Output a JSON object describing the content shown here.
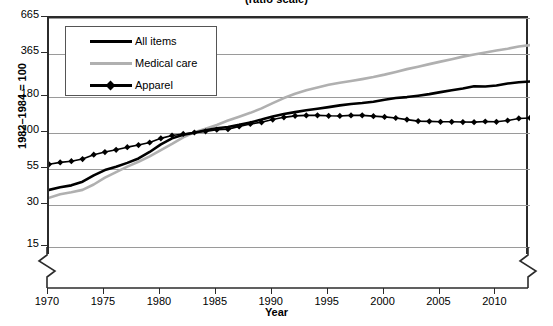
{
  "chart_data": {
    "type": "line",
    "title": "(ratio scale)",
    "xlabel": "Year",
    "ylabel": "1982–1984 = 100",
    "scale": "log",
    "grid": true,
    "legend_position": "top-left",
    "axis_breaks": [
      "y-axis-bottom-left",
      "y-axis-bottom-right"
    ],
    "yticks": [
      15,
      30,
      55,
      100,
      180,
      365,
      665
    ],
    "ytick_labels": [
      "15",
      "30",
      "55",
      "100",
      "180",
      "365",
      "665"
    ],
    "ylim": [
      13,
      665
    ],
    "xticks": [
      1970,
      1975,
      1980,
      1985,
      1990,
      1995,
      2000,
      2005,
      2010
    ],
    "xtick_labels": [
      "1970",
      "1975",
      "1980",
      "1985",
      "1990",
      "1995",
      "2000",
      "2005",
      "2010"
    ],
    "xlim": [
      1970,
      2013
    ],
    "x": [
      1970,
      1971,
      1972,
      1973,
      1974,
      1975,
      1976,
      1977,
      1978,
      1979,
      1980,
      1981,
      1982,
      1983,
      1984,
      1985,
      1986,
      1987,
      1988,
      1989,
      1990,
      1991,
      1992,
      1993,
      1994,
      1995,
      1996,
      1997,
      1998,
      1999,
      2000,
      2001,
      2002,
      2003,
      2004,
      2005,
      2006,
      2007,
      2008,
      2009,
      2010,
      2011,
      2012,
      2013
    ],
    "series": [
      {
        "name": "All items",
        "color": "#000000",
        "marker": "none",
        "values": [
          38.8,
          40.5,
          41.8,
          44.4,
          49.3,
          53.8,
          56.9,
          60.6,
          65.2,
          72.6,
          82.4,
          90.9,
          96.5,
          99.6,
          103.9,
          107.6,
          109.6,
          113.6,
          118.3,
          124.0,
          130.7,
          136.2,
          140.3,
          144.5,
          148.2,
          152.4,
          156.9,
          160.5,
          163.0,
          166.6,
          172.2,
          177.1,
          179.9,
          184.0,
          188.9,
          195.3,
          201.6,
          207.3,
          215.3,
          214.5,
          218.1,
          224.9,
          229.6,
          233.0
        ]
      },
      {
        "name": "Medical care",
        "color": "#b0b0b0",
        "marker": "none",
        "values": [
          34.0,
          36.1,
          37.3,
          38.8,
          42.4,
          47.5,
          52.0,
          57.0,
          61.8,
          67.5,
          74.9,
          82.9,
          92.5,
          100.6,
          106.8,
          113.5,
          122.0,
          130.1,
          138.6,
          149.3,
          162.8,
          177.0,
          190.1,
          201.4,
          211.0,
          220.5,
          228.2,
          234.6,
          242.1,
          250.6,
          260.8,
          272.8,
          285.6,
          297.1,
          310.1,
          323.2,
          336.2,
          351.1,
          364.1,
          375.6,
          388.4,
          400.3,
          414.9,
          425.0
        ]
      },
      {
        "name": "Apparel",
        "color": "#000000",
        "marker": "diamond",
        "values": [
          59.2,
          61.1,
          62.3,
          64.6,
          69.4,
          72.5,
          75.2,
          78.6,
          81.4,
          84.9,
          90.9,
          95.3,
          97.8,
          100.2,
          102.1,
          105.0,
          105.9,
          110.6,
          115.4,
          118.6,
          124.1,
          128.7,
          131.9,
          132.9,
          133.0,
          132.0,
          131.7,
          132.9,
          133.0,
          131.3,
          129.6,
          127.3,
          124.0,
          120.9,
          120.4,
          119.5,
          119.5,
          119.0,
          118.9,
          120.1,
          119.5,
          122.1,
          126.3,
          127.4
        ]
      }
    ]
  },
  "legend": {
    "items": [
      {
        "label": "All items",
        "style": "line-black"
      },
      {
        "label": "Medical care",
        "style": "line-gray"
      },
      {
        "label": "Apparel",
        "style": "line-black-diamond"
      }
    ]
  }
}
